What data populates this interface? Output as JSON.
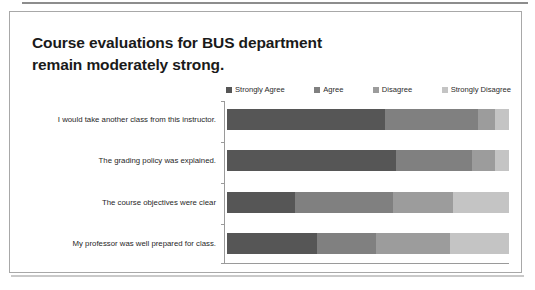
{
  "slide": {
    "title_line1": "Course evaluations for BUS department",
    "title_line2": "remain moderately strong."
  },
  "chart_data": {
    "type": "bar",
    "orientation": "horizontal",
    "stacked": true,
    "normalized_100_percent": true,
    "title": "Course evaluations for BUS department remain moderately strong.",
    "xlabel": "",
    "ylabel": "",
    "xlim": [
      0,
      100
    ],
    "grid": false,
    "legend_position": "top-right",
    "categories": [
      "I would take another class from this instructor.",
      "The grading policy was explained.",
      "The course objectives were clear",
      "My professor was well prepared for class."
    ],
    "series": [
      {
        "name": "Strongly Agree",
        "color": "#565656",
        "values": [
          56,
          60,
          24,
          32
        ]
      },
      {
        "name": "Agree",
        "color": "#808080",
        "values": [
          33,
          27,
          35,
          21
        ]
      },
      {
        "name": "Disagree",
        "color": "#9c9c9c",
        "values": [
          6,
          8,
          21,
          26
        ]
      },
      {
        "name": "Strongly Disagree",
        "color": "#c4c4c4",
        "values": [
          5,
          5,
          20,
          21
        ]
      }
    ]
  },
  "colors": {
    "strongly_agree": "#565656",
    "agree": "#808080",
    "disagree": "#9c9c9c",
    "strongly_disagree": "#c4c4c4",
    "axis": "#9a9a9a",
    "frame": "#a8a8a8",
    "text": "#1a1a1a"
  }
}
